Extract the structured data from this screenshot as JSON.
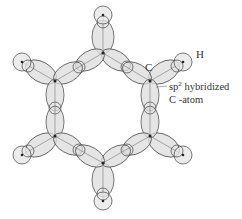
{
  "diagram": {
    "labels": {
      "h": "H",
      "c": "C",
      "hybrid_line1_prefix": "sp",
      "hybrid_sup": "2",
      "hybrid_line1_suffix": " hybridized",
      "hybrid_line2": "C -atom"
    },
    "colors": {
      "lobe_fill": "#dcdcdc",
      "stroke": "#555555",
      "nucleus": "#222222"
    },
    "carbons": [
      {
        "name": "top",
        "x": 103,
        "y": 53
      },
      {
        "name": "upper-right",
        "x": 150,
        "y": 81
      },
      {
        "name": "lower-right",
        "x": 150,
        "y": 136
      },
      {
        "name": "bottom",
        "x": 103,
        "y": 163
      },
      {
        "name": "lower-left",
        "x": 55,
        "y": 136
      },
      {
        "name": "upper-left",
        "x": 55,
        "y": 81
      }
    ],
    "hydrogens": [
      {
        "name": "top",
        "x": 103,
        "y": 15
      },
      {
        "name": "upper-right",
        "x": 183,
        "y": 62
      },
      {
        "name": "lower-right",
        "x": 183,
        "y": 155
      },
      {
        "name": "bottom",
        "x": 103,
        "y": 201
      },
      {
        "name": "lower-left",
        "x": 22,
        "y": 155
      },
      {
        "name": "upper-left",
        "x": 22,
        "y": 62
      }
    ]
  }
}
